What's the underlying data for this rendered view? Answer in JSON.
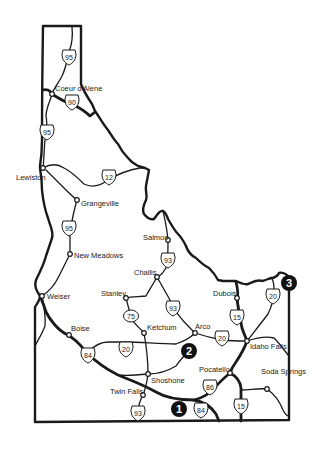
{
  "map": {
    "region": "Idaho",
    "colors": {
      "ink": "#1a1a1a",
      "background": "#ffffff",
      "marker_fill": "#111111"
    },
    "cities": [
      {
        "name": "Coeur d'Alene",
        "x": 52,
        "y": 94
      },
      {
        "name": "Lewiston",
        "x": 43,
        "y": 168
      },
      {
        "name": "Grangeville",
        "x": 77,
        "y": 200
      },
      {
        "name": "New Meadows",
        "x": 70,
        "y": 254
      },
      {
        "name": "Salmon",
        "x": 168,
        "y": 240
      },
      {
        "name": "Challis",
        "x": 157,
        "y": 277
      },
      {
        "name": "Stanley",
        "x": 126,
        "y": 298
      },
      {
        "name": "Weiser",
        "x": 42,
        "y": 296
      },
      {
        "name": "Dubois",
        "x": 237,
        "y": 298
      },
      {
        "name": "Boise",
        "x": 69,
        "y": 335
      },
      {
        "name": "Ketchum",
        "x": 144,
        "y": 333
      },
      {
        "name": "Arco",
        "x": 195,
        "y": 333
      },
      {
        "name": "Idaho Falls",
        "x": 247,
        "y": 341
      },
      {
        "name": "Pocatello",
        "x": 230,
        "y": 373
      },
      {
        "name": "Shoshone",
        "x": 148,
        "y": 374
      },
      {
        "name": "Soda Springs",
        "x": 267,
        "y": 389
      },
      {
        "name": "Twin Falls",
        "x": 143,
        "y": 395
      }
    ],
    "highway_shields": [
      {
        "number": "95",
        "x": 69,
        "y": 57
      },
      {
        "number": "90",
        "x": 72,
        "y": 102
      },
      {
        "number": "95",
        "x": 47,
        "y": 132
      },
      {
        "number": "12",
        "x": 109,
        "y": 177
      },
      {
        "number": "95",
        "x": 69,
        "y": 228
      },
      {
        "number": "93",
        "x": 168,
        "y": 260
      },
      {
        "number": "93",
        "x": 173,
        "y": 308
      },
      {
        "number": "75",
        "x": 131,
        "y": 316
      },
      {
        "number": "20",
        "x": 126,
        "y": 349
      },
      {
        "number": "20",
        "x": 222,
        "y": 338
      },
      {
        "number": "15",
        "x": 237,
        "y": 317
      },
      {
        "number": "20",
        "x": 273,
        "y": 296
      },
      {
        "number": "84",
        "x": 88,
        "y": 355
      },
      {
        "number": "86",
        "x": 210,
        "y": 387
      },
      {
        "number": "93",
        "x": 138,
        "y": 413
      },
      {
        "number": "84",
        "x": 201,
        "y": 410
      },
      {
        "number": "15",
        "x": 241,
        "y": 406
      }
    ],
    "numbered_markers": [
      {
        "label": "1",
        "x": 179,
        "y": 409
      },
      {
        "label": "2",
        "x": 189,
        "y": 351
      },
      {
        "label": "3",
        "x": 289,
        "y": 283
      }
    ]
  }
}
